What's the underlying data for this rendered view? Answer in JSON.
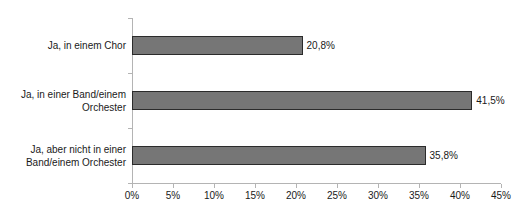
{
  "chart_data": {
    "type": "bar",
    "orientation": "horizontal",
    "title": "",
    "xlabel": "",
    "ylabel": "",
    "grid": false,
    "legend": "none",
    "xlim": [
      0,
      45
    ],
    "xtick_labels": [
      "0%",
      "5%",
      "10%",
      "15%",
      "20%",
      "25%",
      "30%",
      "35%",
      "40%",
      "45%"
    ],
    "xticks": [
      0,
      5,
      10,
      15,
      20,
      25,
      30,
      35,
      40,
      45
    ],
    "categories": [
      "Ja, in einem Chor",
      "Ja, in einer Band/einem\nOrchester",
      "Ja, aber nicht in einer\nBand/einem Orchester"
    ],
    "values": [
      20.8,
      41.5,
      35.8
    ],
    "data_labels": [
      "20,8%",
      "41,5%",
      "35,8%"
    ],
    "bar_fill_color": "#767676",
    "bar_border_color": "#2b2b2b",
    "axis_color": "#b4b4b4",
    "text_color": "#1a1a1a",
    "background_color": "#ffffff"
  }
}
